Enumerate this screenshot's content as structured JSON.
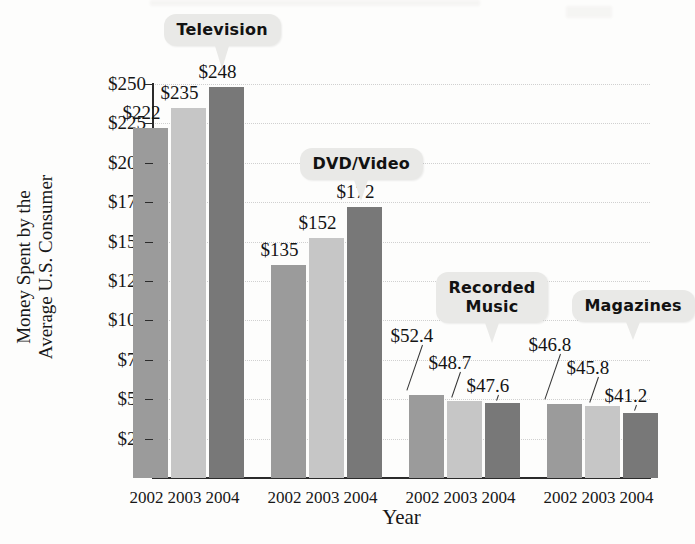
{
  "chart_data": {
    "type": "bar",
    "title": "",
    "xlabel": "Year",
    "ylabel": "Money Spent by the\nAverage U.S. Consumer",
    "ylabel_line1": "Money Spent by the",
    "ylabel_line2": "Average U.S. Consumer",
    "ylim": [
      0,
      250
    ],
    "ytick_labels": [
      "$250",
      "$225",
      "$200",
      "$175",
      "$150",
      "$125",
      "$100",
      "$75",
      "$50",
      "$25"
    ],
    "ytick_values": [
      250,
      225,
      200,
      175,
      150,
      125,
      100,
      75,
      50,
      25
    ],
    "grid": true,
    "legend": "none",
    "categories": [
      "2002",
      "2003",
      "2004"
    ],
    "groups": [
      {
        "name": "Television",
        "callout": "Television",
        "bars": [
          {
            "year": "2002",
            "value": 222,
            "label": "$222",
            "series": 0
          },
          {
            "year": "2003",
            "value": 235,
            "label": "$235",
            "series": 1
          },
          {
            "year": "2004",
            "value": 248,
            "label": "$248",
            "series": 2
          }
        ]
      },
      {
        "name": "DVD/Video",
        "callout": "DVD/Video",
        "bars": [
          {
            "year": "2002",
            "value": 135,
            "label": "$135",
            "series": 0
          },
          {
            "year": "2003",
            "value": 152,
            "label": "$152",
            "series": 1
          },
          {
            "year": "2004",
            "value": 172,
            "label": "$172",
            "series": 2
          }
        ]
      },
      {
        "name": "Recorded Music",
        "callout": "Recorded\nMusic",
        "callout_line1": "Recorded",
        "callout_line2": "Music",
        "bars": [
          {
            "year": "2002",
            "value": 52.4,
            "label": "$52.4",
            "series": 0
          },
          {
            "year": "2003",
            "value": 48.7,
            "label": "$48.7",
            "series": 1
          },
          {
            "year": "2004",
            "value": 47.6,
            "label": "$47.6",
            "series": 2
          }
        ]
      },
      {
        "name": "Magazines",
        "callout": "Magazines",
        "bars": [
          {
            "year": "2002",
            "value": 46.8,
            "label": "$46.8",
            "series": 0
          },
          {
            "year": "2003",
            "value": 45.8,
            "label": "$45.8",
            "series": 1
          },
          {
            "year": "2004",
            "value": 41.2,
            "label": "$41.2",
            "series": 2
          }
        ]
      }
    ],
    "series_colors": [
      "#9b9b9b",
      "#c6c6c6",
      "#787878"
    ]
  }
}
